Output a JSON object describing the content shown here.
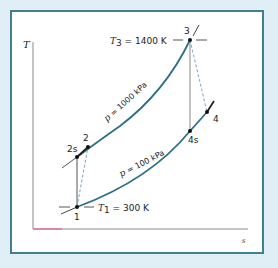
{
  "diagram": {
    "type": "T-s diagram (Brayton cycle)",
    "axes": {
      "y_label": "T",
      "x_label": "s"
    },
    "isobars": [
      {
        "label_p": "p",
        "label_rest": " = 1000 kPa",
        "color": "#2f6f86"
      },
      {
        "label_p": "p",
        "label_rest": " = 100 kPa",
        "color": "#2f6f86"
      }
    ],
    "points": [
      {
        "id": "1",
        "label": "1"
      },
      {
        "id": "2s",
        "label": "2s"
      },
      {
        "id": "2",
        "label": "2"
      },
      {
        "id": "3",
        "label": "3"
      },
      {
        "id": "4s",
        "label": "4s"
      },
      {
        "id": "4",
        "label": "4"
      }
    ],
    "annotations": {
      "t3_var": "T",
      "t3_sub": "3",
      "t3_value": " = 1400 K",
      "t1_var": "T",
      "t1_sub": "1",
      "t1_value": " = 300 K"
    },
    "colors": {
      "background": "#e0eef5",
      "border": "#3f7f90",
      "isobar": "#2f6f86",
      "axis": "#888888",
      "axis_accent": "#e8609a",
      "process_line": "#777777",
      "dashed_line": "#5a8fb0"
    }
  }
}
